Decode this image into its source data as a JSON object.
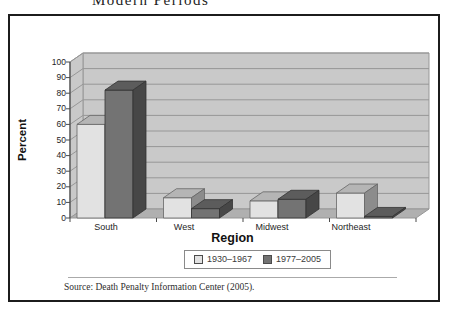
{
  "page": {
    "top_title_fragment": "Modern Periods",
    "source": "Source: Death Penalty Information Center (2005)."
  },
  "chart_data": {
    "type": "bar",
    "style": "3d-column",
    "title": "",
    "xlabel": "Region",
    "ylabel": "Percent",
    "categories": [
      "South",
      "West",
      "Midwest",
      "Northeast"
    ],
    "series": [
      {
        "name": "1930–1967",
        "color": "#e2e2e2",
        "values": [
          60,
          13,
          11,
          16
        ]
      },
      {
        "name": "1977–2005",
        "color": "#737373",
        "values": [
          82,
          6,
          12,
          1
        ]
      }
    ],
    "ylim": [
      0,
      100
    ],
    "ytick_step": 10,
    "grid": true,
    "legend_position": "bottom",
    "wall_color": "#c9c9c9",
    "floor_color": "#b0b0b0",
    "gridline_color": "#979797"
  }
}
